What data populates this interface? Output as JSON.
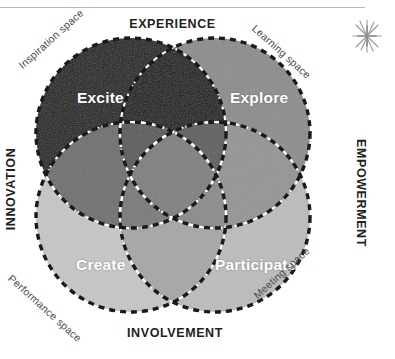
{
  "diagram": {
    "axes": [
      {
        "key": "top",
        "label": "EXPERIENCE"
      },
      {
        "key": "bottom",
        "label": "INVOLVEMENT"
      },
      {
        "key": "left",
        "label": "INNOVATION"
      },
      {
        "key": "right",
        "label": "EMPOWERMENT"
      }
    ],
    "spaces": [
      {
        "key": "top-left",
        "label": "Inspiration space"
      },
      {
        "key": "top-right",
        "label": "Learning space"
      },
      {
        "key": "bottom-left",
        "label": "Performance space"
      },
      {
        "key": "bottom-right",
        "label": "Meeting space"
      }
    ],
    "circles": [
      {
        "key": "excite",
        "label": "Excite",
        "fill": "#171717",
        "position": "top-left"
      },
      {
        "key": "explore",
        "label": "Explore",
        "fill": "#8c8c8c",
        "position": "top-right"
      },
      {
        "key": "create",
        "label": "Create",
        "fill": "#c6c6c6",
        "position": "bottom-left"
      },
      {
        "key": "participate",
        "label": "Participate",
        "fill": "#bcbcbc",
        "position": "bottom-right"
      }
    ],
    "colors": {
      "background": "#ffffff",
      "text": "#231f20",
      "space_text": "#4a4a4a",
      "circle_outline": "#1a1a1a",
      "inner_divider": "#ffffff",
      "star": "#9a9a9a",
      "rule": "#b9b9b9"
    },
    "star_icon": "asterisk-star-doodle"
  }
}
